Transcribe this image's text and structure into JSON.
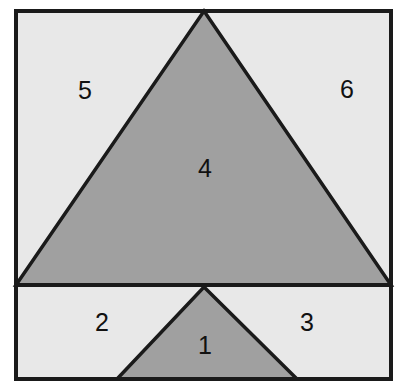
{
  "figure": {
    "canvas": {
      "width": 401,
      "height": 388
    },
    "colors": {
      "page_background": "#ffffff",
      "light_fill": "#e8e8e8",
      "dark_fill": "#a0a0a0",
      "stroke": "#1a1a1a",
      "label_color": "#111111"
    },
    "stroke_widths": {
      "outer_border": 4,
      "divider": 4,
      "triangle_edge": 3.5
    },
    "geometry": {
      "outer_rect": {
        "x": 16,
        "y": 11,
        "width": 375,
        "height": 368
      },
      "divider_line": {
        "x1": 16,
        "y1": 285,
        "x2": 391,
        "y2": 285
      },
      "large_triangle": {
        "apex": [
          204,
          11
        ],
        "base_left": [
          16,
          285
        ],
        "base_right": [
          391,
          285
        ],
        "points": "204,11 391,285 16,285"
      },
      "small_triangle": {
        "apex": [
          204,
          287
        ],
        "base_left": [
          117,
          379
        ],
        "base_right": [
          297,
          379
        ],
        "points": "204,287 297,379 117,379"
      }
    },
    "regions": [
      {
        "id": "region-1",
        "label": "1",
        "x": 205,
        "y": 347,
        "shade": "dark",
        "description": "small triangle interior, bottom strip"
      },
      {
        "id": "region-2",
        "label": "2",
        "x": 102,
        "y": 324,
        "shade": "light",
        "description": "bottom strip left of small triangle"
      },
      {
        "id": "region-3",
        "label": "3",
        "x": 307,
        "y": 324,
        "shade": "light",
        "description": "bottom strip right of small triangle"
      },
      {
        "id": "region-4",
        "label": "4",
        "x": 205,
        "y": 170,
        "shade": "dark",
        "description": "large triangle interior, upper area"
      },
      {
        "id": "region-5",
        "label": "5",
        "x": 85,
        "y": 92,
        "shade": "light",
        "description": "upper area left of large triangle"
      },
      {
        "id": "region-6",
        "label": "6",
        "x": 347,
        "y": 91,
        "shade": "light",
        "description": "upper area right of large triangle"
      }
    ]
  }
}
